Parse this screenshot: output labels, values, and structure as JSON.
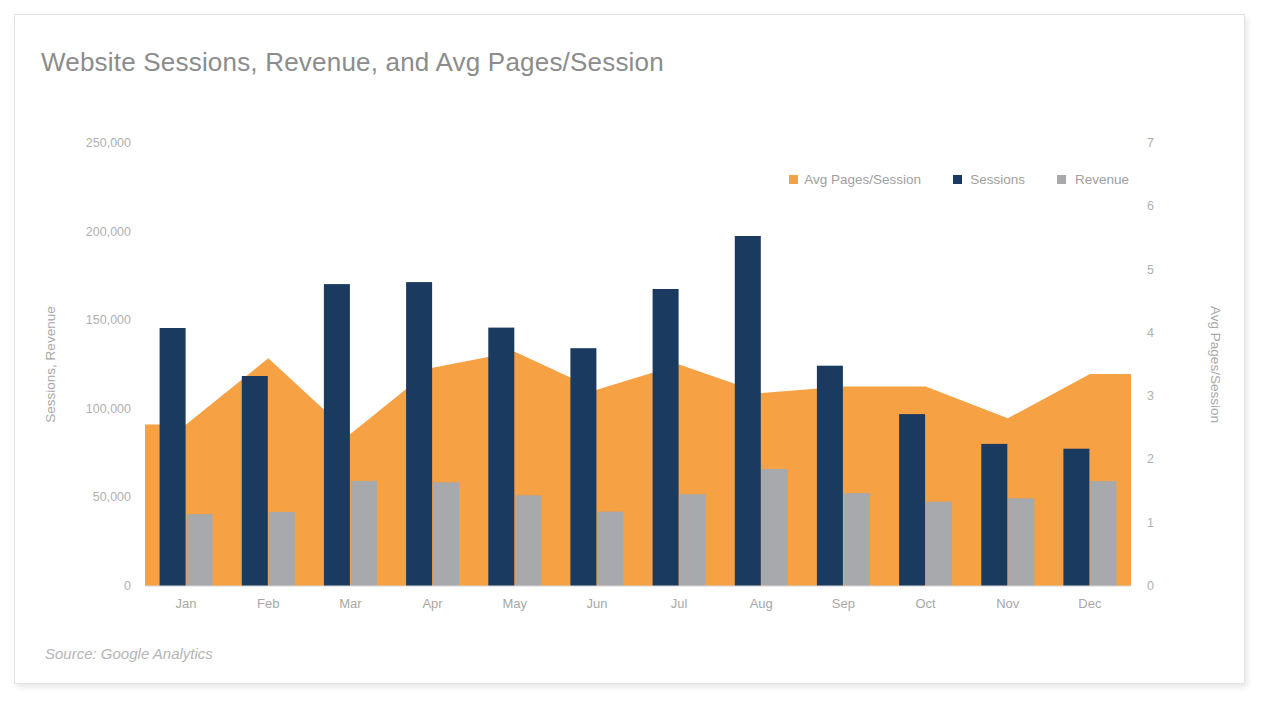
{
  "card": {
    "title": "Website Sessions, Revenue, and Avg Pages/Session",
    "source_note": "Source: Google Analytics"
  },
  "colors": {
    "sessions": "#1b3a5f",
    "revenue": "#a7a9ac",
    "avg_pages": "#f6a143",
    "text_muted": "#a8a8a8",
    "title": "#8c8c8c",
    "card_border": "#e3e3e3"
  },
  "legend": {
    "position": "top-right",
    "items": [
      {
        "label": "Avg Pages/Session",
        "color": "#f6a143",
        "marker": "square-marker"
      },
      {
        "label": "Sessions",
        "color": "#1b3a5f",
        "marker": "square-marker"
      },
      {
        "label": "Revenue",
        "color": "#a7a9ac",
        "marker": "square-marker"
      }
    ]
  },
  "chart_data": {
    "type": "bar",
    "title": "Website Sessions, Revenue, and Avg Pages/Session",
    "subtitle": "",
    "xlabel": "",
    "ylabel": "Sessions, Revenue",
    "y2label": "Avg Pages/Session",
    "categories": [
      "Jan",
      "Feb",
      "Mar",
      "Apr",
      "May",
      "Jun",
      "Jul",
      "Aug",
      "Sep",
      "Oct",
      "Nov",
      "Dec"
    ],
    "ylim": [
      0,
      250000
    ],
    "y2lim": [
      0,
      7
    ],
    "yticks": [
      0,
      50000,
      100000,
      150000,
      200000,
      250000
    ],
    "ytick_labels": [
      "0",
      "50,000",
      "100,000",
      "150,000",
      "200,000",
      "250,000"
    ],
    "y2ticks": [
      0,
      1,
      2,
      3,
      4,
      5,
      6,
      7
    ],
    "y2tick_labels": [
      "0",
      "1",
      "2",
      "3",
      "4",
      "5",
      "6",
      "7"
    ],
    "grid": false,
    "legend": [
      "Avg Pages/Session",
      "Sessions",
      "Revenue"
    ],
    "series": [
      {
        "name": "Avg Pages/Session",
        "type": "area",
        "axis": "right",
        "color": "#f6a143",
        "values": [
          2.55,
          3.6,
          2.4,
          3.45,
          3.7,
          3.1,
          3.5,
          3.05,
          3.15,
          3.15,
          2.65,
          3.35
        ]
      },
      {
        "name": "Sessions",
        "type": "bar",
        "axis": "left",
        "color": "#1b3a5f",
        "values": [
          145600,
          118500,
          170400,
          171500,
          145800,
          134200,
          167600,
          197500,
          124300,
          97000,
          80200,
          77500
        ]
      },
      {
        "name": "Revenue",
        "type": "bar",
        "axis": "left",
        "color": "#a7a9ac",
        "values": [
          40600,
          41800,
          59300,
          58500,
          51200,
          42000,
          51800,
          66000,
          52400,
          47600,
          49500,
          59200
        ]
      }
    ]
  }
}
